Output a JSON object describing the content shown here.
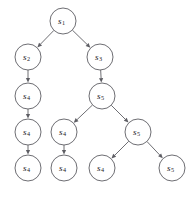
{
  "figure": {
    "type": "tree-diagram",
    "name": "state-transition-tree",
    "background_color": "#ffffff",
    "node_stroke_color": "#5d5d63",
    "node_fill_color": "#ffffff",
    "edge_color": "#5d5d63",
    "label_color": "#1b1b1b",
    "node_radius": 13
  },
  "nodes": [
    {
      "id": "n1",
      "label": "s",
      "subscript": "1",
      "text": "s1",
      "x": 63,
      "y": 21
    },
    {
      "id": "n2",
      "label": "s",
      "subscript": "2",
      "text": "s2",
      "x": 28,
      "y": 57
    },
    {
      "id": "n3",
      "label": "s",
      "subscript": "3",
      "text": "s3",
      "x": 100,
      "y": 57
    },
    {
      "id": "n4",
      "label": "s",
      "subscript": "4",
      "text": "s4",
      "x": 28,
      "y": 96
    },
    {
      "id": "n5",
      "label": "s",
      "subscript": "5",
      "text": "s5",
      "x": 102,
      "y": 96
    },
    {
      "id": "n6",
      "label": "s",
      "subscript": "4",
      "text": "s4",
      "x": 28,
      "y": 132
    },
    {
      "id": "n7",
      "label": "s",
      "subscript": "4",
      "text": "s4",
      "x": 64,
      "y": 132
    },
    {
      "id": "n8",
      "label": "s",
      "subscript": "5",
      "text": "s5",
      "x": 138,
      "y": 132
    },
    {
      "id": "n9",
      "label": "s",
      "subscript": "4",
      "text": "s4",
      "x": 28,
      "y": 168
    },
    {
      "id": "n10",
      "label": "s",
      "subscript": "4",
      "text": "s4",
      "x": 64,
      "y": 168
    },
    {
      "id": "n11",
      "label": "s",
      "subscript": "4",
      "text": "s4",
      "x": 102,
      "y": 168
    },
    {
      "id": "n12",
      "label": "s",
      "subscript": "5",
      "text": "s5",
      "x": 172,
      "y": 168
    }
  ],
  "edges": [
    {
      "from": "n1",
      "to": "n2",
      "directed": true
    },
    {
      "from": "n1",
      "to": "n3",
      "directed": true
    },
    {
      "from": "n2",
      "to": "n4",
      "directed": true
    },
    {
      "from": "n3",
      "to": "n5",
      "directed": true
    },
    {
      "from": "n4",
      "to": "n6",
      "directed": true
    },
    {
      "from": "n5",
      "to": "n7",
      "directed": true
    },
    {
      "from": "n5",
      "to": "n8",
      "directed": true
    },
    {
      "from": "n6",
      "to": "n9",
      "directed": true
    },
    {
      "from": "n7",
      "to": "n10",
      "directed": true
    },
    {
      "from": "n8",
      "to": "n11",
      "directed": true
    },
    {
      "from": "n8",
      "to": "n12",
      "directed": true
    }
  ],
  "caption": {
    "text": ""
  }
}
